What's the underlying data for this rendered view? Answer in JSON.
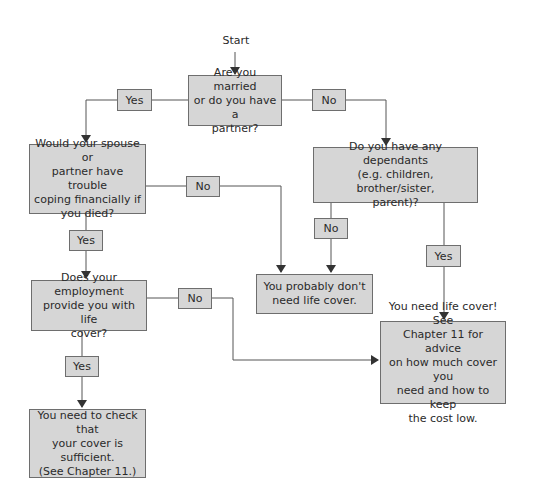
{
  "diagram": {
    "start_label": "Start",
    "nodes": {
      "q_married": "Are you married\nor do you have a\npartner?",
      "q_spouse_trouble": "Would your spouse or\npartner have trouble\ncoping financially if\nyou died?",
      "q_dependants": "Do you have any dependants\n(e.g. children, brother/sister,\nparent)?",
      "r_probably_not": "You probably don't\nneed life cover.",
      "q_employment": "Does your employment\nprovide you with life\ncover?",
      "r_need_cover": "You need life cover! See\nChapter 11 for advice\non how much cover you\nneed and how to keep\nthe cost low.",
      "r_check_cover": "You need to check that\nyour cover is\nsufficient.\n(See Chapter 11.)"
    },
    "edge_labels": {
      "married_yes": "Yes",
      "married_no": "No",
      "spouse_no": "No",
      "spouse_yes": "Yes",
      "dependants_no": "No",
      "dependants_yes": "Yes",
      "employment_no": "No",
      "employment_yes": "Yes"
    },
    "colors": {
      "box_fill": "#d6d6d6",
      "box_border": "#6e6e6e",
      "line": "#444444"
    }
  }
}
